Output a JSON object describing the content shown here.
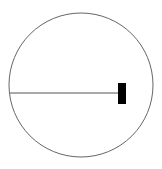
{
  "diagram": {
    "canvas": {
      "width": 162,
      "height": 169,
      "background": "#ffffff"
    },
    "circle": {
      "cx": 81,
      "cy": 85,
      "r": 72,
      "stroke": "#666666",
      "stroke_width": 1
    },
    "radius_line": {
      "x1": 10,
      "y1": 93,
      "x2": 118,
      "y2": 93,
      "stroke": "#555555",
      "stroke_width": 1
    },
    "block": {
      "x": 118,
      "y": 83,
      "width": 8,
      "height": 21,
      "fill": "#000000"
    }
  }
}
